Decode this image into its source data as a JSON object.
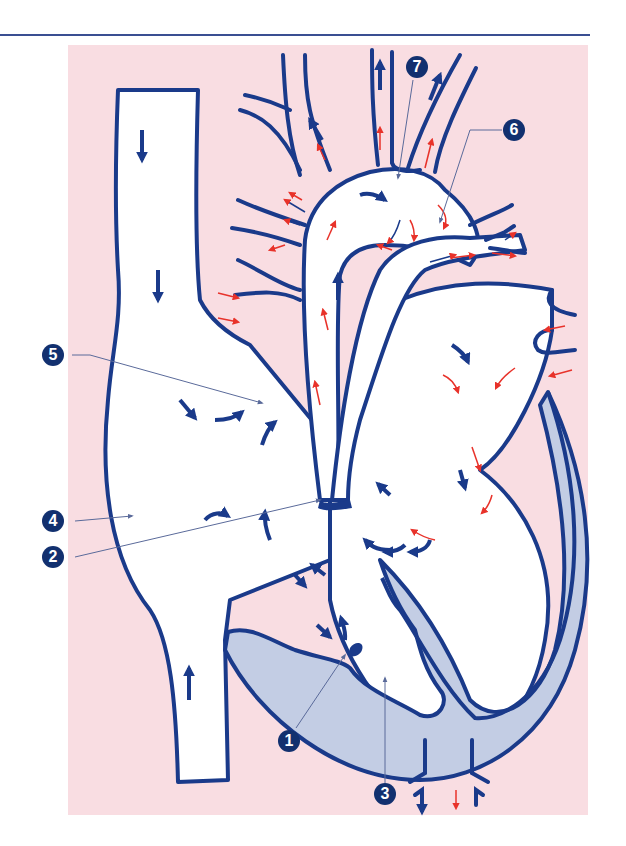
{
  "figure": {
    "type": "anatomical-diagram",
    "colors": {
      "background_panel": "#f9dde2",
      "outline": "#1a3a8a",
      "wall_fill": "#c3cde4",
      "oxygenated_arrow": "#e8322a",
      "deoxygenated_arrow": "#1a3a8a",
      "label_badge": "#12306f"
    },
    "labels": [
      {
        "id": "1",
        "text": "1"
      },
      {
        "id": "2",
        "text": "2"
      },
      {
        "id": "3",
        "text": "3"
      },
      {
        "id": "4",
        "text": "4"
      },
      {
        "id": "5",
        "text": "5"
      },
      {
        "id": "6",
        "text": "6"
      },
      {
        "id": "7",
        "text": "7"
      }
    ]
  }
}
